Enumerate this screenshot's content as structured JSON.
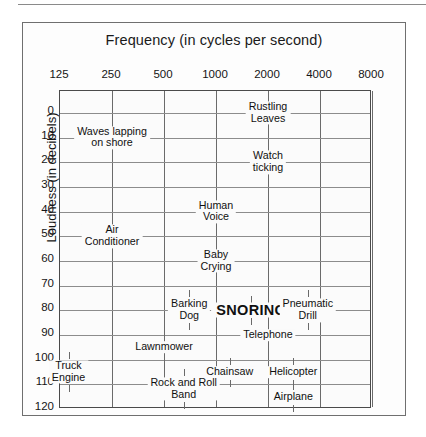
{
  "figure": {
    "title": "Frequency (in cycles per second)",
    "y_axis_label": "Loudness (in decibels)"
  },
  "chart_data": {
    "type": "scatter",
    "title": "Frequency (in cycles per second)",
    "xlabel": "Frequency (in cycles per second)",
    "ylabel": "Loudness (in decibels)",
    "x_scale": "log2-octave",
    "x_ticks": [
      "125",
      "250",
      "500",
      "1000",
      "2000",
      "4000",
      "8000"
    ],
    "y_ticks": [
      "0",
      "10",
      "20",
      "30",
      "40",
      "50",
      "60",
      "70",
      "80",
      "90",
      "100",
      "110",
      "120"
    ],
    "ylim": [
      0,
      120
    ],
    "y_inverted": false,
    "grid": true,
    "legend": "none",
    "points": [
      {
        "label": "Rustling\nLeaves",
        "line1": "Rustling",
        "line2": "Leaves",
        "frequency": 2000,
        "loudness": 0,
        "emphasis": "normal"
      },
      {
        "label": "Waves lapping\non shore",
        "line1": "Waves lapping",
        "line2": "on shore",
        "frequency": 250,
        "loudness": 10,
        "emphasis": "normal"
      },
      {
        "label": "Watch\nticking",
        "line1": "Watch",
        "line2": "ticking",
        "frequency": 2000,
        "loudness": 20,
        "emphasis": "normal"
      },
      {
        "label": "Human\nVoice",
        "line1": "Human",
        "line2": "Voice",
        "frequency": 1000,
        "loudness": 40,
        "emphasis": "normal"
      },
      {
        "label": "Air\nConditioner",
        "line1": "Air",
        "line2": "Conditioner",
        "frequency": 250,
        "loudness": 50,
        "emphasis": "normal"
      },
      {
        "label": "Baby\nCrying",
        "line1": "Baby",
        "line2": "Crying",
        "frequency": 1000,
        "loudness": 60,
        "emphasis": "normal"
      },
      {
        "label": "Barking\nDog",
        "line1": "Barking",
        "line2": "Dog",
        "frequency": 700,
        "loudness": 80,
        "emphasis": "normal"
      },
      {
        "label": "SNORING",
        "line1": "SNORING",
        "line2": "",
        "frequency": 1600,
        "loudness": 80,
        "emphasis": "bold"
      },
      {
        "label": "Pneumatic\nDrill",
        "line1": "Pneumatic",
        "line2": "Drill",
        "frequency": 3400,
        "loudness": 80,
        "emphasis": "normal"
      },
      {
        "label": "Telephone",
        "line1": "Telephone",
        "line2": "",
        "frequency": 2000,
        "loudness": 90,
        "emphasis": "normal"
      },
      {
        "label": "Lawnmower",
        "line1": "Lawnmower",
        "line2": "",
        "frequency": 500,
        "loudness": 95,
        "emphasis": "normal"
      },
      {
        "label": "Truck\nEngine",
        "line1": "Truck",
        "line2": "Engine",
        "frequency": 140,
        "loudness": 105,
        "emphasis": "normal"
      },
      {
        "label": "Chainsaw",
        "line1": "Chainsaw",
        "line2": "",
        "frequency": 1200,
        "loudness": 105,
        "emphasis": "normal"
      },
      {
        "label": "Helicopter",
        "line1": "Helicopter",
        "line2": "",
        "frequency": 2800,
        "loudness": 105,
        "emphasis": "normal"
      },
      {
        "label": "Rock and Roll\nBand",
        "line1": "Rock and Roll",
        "line2": "Band",
        "frequency": 650,
        "loudness": 112,
        "emphasis": "normal"
      },
      {
        "label": "Airplane",
        "line1": "Airplane",
        "line2": "",
        "frequency": 2800,
        "loudness": 115,
        "emphasis": "normal"
      }
    ]
  }
}
